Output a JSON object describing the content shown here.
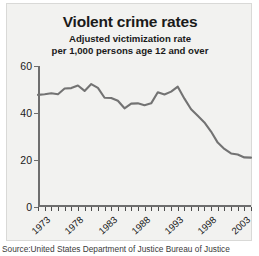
{
  "chart_data": {
    "type": "line",
    "title": "Violent crime rates",
    "subtitle_line1": "Adjusted victimization rate",
    "subtitle_line2": "per 1,000 persons age 12 and over",
    "xlabel": "",
    "ylabel": "",
    "xlim": [
      1973,
      2005
    ],
    "ylim": [
      0,
      60
    ],
    "yticks": [
      0,
      20,
      40,
      60
    ],
    "ytick_labels": [
      "0",
      "20",
      "40",
      "60"
    ],
    "xticks": [
      1973,
      1974,
      1975,
      1976,
      1977,
      1978,
      1979,
      1980,
      1981,
      1982,
      1983,
      1984,
      1985,
      1986,
      1987,
      1988,
      1989,
      1990,
      1991,
      1992,
      1993,
      1994,
      1995,
      1996,
      1997,
      1998,
      1999,
      2000,
      2001,
      2002,
      2003,
      2004,
      2005
    ],
    "xtick_labels": [
      "1973",
      "1978",
      "1983",
      "1988",
      "1993",
      "1998",
      "2003"
    ],
    "xtick_label_years": [
      1973,
      1978,
      1983,
      1988,
      1993,
      1998,
      2003
    ],
    "grid": false,
    "legend": false,
    "line_color": "#737373",
    "background_color": "#f2f2f0",
    "x": [
      1973,
      1974,
      1975,
      1976,
      1977,
      1978,
      1979,
      1980,
      1981,
      1982,
      1983,
      1984,
      1985,
      1986,
      1987,
      1988,
      1989,
      1990,
      1991,
      1992,
      1993,
      1994,
      1995,
      1996,
      1997,
      1998,
      1999,
      2000,
      2001,
      2002,
      2003,
      2004,
      2005
    ],
    "values": [
      47.7,
      48.0,
      48.4,
      48.0,
      50.4,
      50.6,
      51.7,
      49.4,
      52.3,
      50.7,
      46.5,
      46.4,
      45.2,
      42.0,
      44.0,
      44.1,
      43.3,
      44.1,
      48.8,
      47.9,
      49.1,
      51.2,
      46.1,
      41.6,
      38.8,
      36.0,
      32.1,
      27.4,
      24.7,
      22.8,
      22.3,
      21.1,
      21.0
    ],
    "annotations": []
  },
  "source": {
    "text": "Source:United States Department of Justice Bureau of Justice"
  }
}
